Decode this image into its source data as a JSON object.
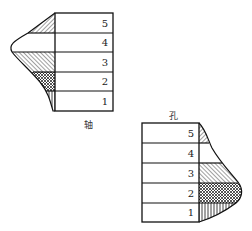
{
  "shaft": {
    "caption": "轴",
    "rows": [
      "5",
      "4",
      "3",
      "2",
      "1"
    ]
  },
  "hole": {
    "caption": "孔",
    "rows": [
      "5",
      "4",
      "3",
      "2",
      "1"
    ]
  },
  "colors": {
    "line": "#111111",
    "background": "#ffffff"
  }
}
